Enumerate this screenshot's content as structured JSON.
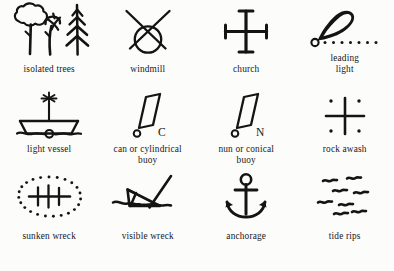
{
  "page": {
    "kind": "nautical-chart-symbol-legend",
    "background_color": "#fcfcfa",
    "ink_color": "#141414",
    "columns": 4,
    "rows": 3
  },
  "symbols": [
    {
      "id": "isolated-trees",
      "label": "isolated trees",
      "icon_name": "isolated-trees-icon",
      "row": 1,
      "column": 1
    },
    {
      "id": "windmill",
      "label": "windmill",
      "icon_name": "windmill-icon",
      "row": 1,
      "column": 2
    },
    {
      "id": "church",
      "label": "church",
      "icon_name": "church-cross-icon",
      "row": 1,
      "column": 3
    },
    {
      "id": "leading-light",
      "label": "leading\nlight",
      "icon_name": "leading-light-icon",
      "row": 1,
      "column": 4
    },
    {
      "id": "light-vessel",
      "label": "light  vessel",
      "icon_name": "light-vessel-icon",
      "row": 2,
      "column": 1
    },
    {
      "id": "can-buoy",
      "label": "can or cylindrical\nbuoy",
      "icon_name": "can-buoy-icon",
      "annotation": "C",
      "row": 2,
      "column": 2
    },
    {
      "id": "nun-buoy",
      "label": "nun or conical\nbuoy",
      "icon_name": "nun-buoy-icon",
      "annotation": "N",
      "row": 2,
      "column": 3
    },
    {
      "id": "rock-awash",
      "label": "rock  awash",
      "icon_name": "rock-awash-icon",
      "row": 2,
      "column": 4
    },
    {
      "id": "sunken-wreck",
      "label": "sunken  wreck",
      "icon_name": "sunken-wreck-icon",
      "row": 3,
      "column": 1
    },
    {
      "id": "visible-wreck",
      "label": "visible wreck",
      "icon_name": "visible-wreck-icon",
      "row": 3,
      "column": 2
    },
    {
      "id": "anchorage",
      "label": "anchorage",
      "icon_name": "anchor-icon",
      "row": 3,
      "column": 3
    },
    {
      "id": "tide-rips",
      "label": "tide rips",
      "icon_name": "tide-rips-icon",
      "row": 3,
      "column": 4
    }
  ]
}
